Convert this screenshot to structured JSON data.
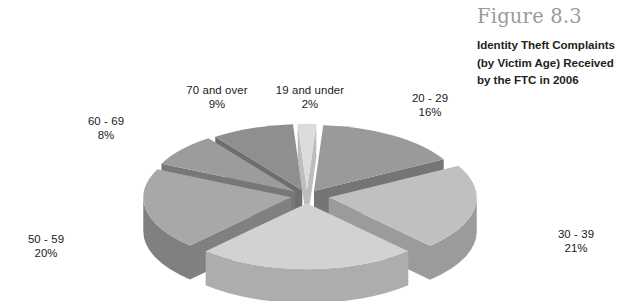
{
  "figure": {
    "number": "Figure 8.3",
    "caption_lines": [
      "Identity Theft Complaints",
      "(by Victim Age) Received",
      "by the FTC in 2006"
    ]
  },
  "chart_data": {
    "type": "pie",
    "title": "Identity Theft Complaints (by Victim Age) Received by the FTC in 2006",
    "subtitle": "Figure 8.3",
    "xlabel": "",
    "ylabel": "",
    "grid": false,
    "legend_position": "none",
    "style": "exploded-3d",
    "units": "percent",
    "background": "#ffffff",
    "categories": [
      "19 and under",
      "20 - 29",
      "30 - 39",
      "40 - 49",
      "50 - 59",
      "60 - 69",
      "70 and over"
    ],
    "values": [
      2,
      16,
      21,
      24,
      20,
      8,
      9
    ],
    "labels_shown": [
      "19 and under",
      "20 - 29",
      "30 - 39",
      "",
      "50 - 59",
      "60 - 69",
      "70 and over"
    ],
    "value_labels": [
      "2%",
      "16%",
      "21%",
      "",
      "20%",
      "8%",
      "9%"
    ],
    "colors": [
      "#dcdcdc",
      "#9a9a9a",
      "#c0c0c0",
      "#d2d2d2",
      "#a8a8a8",
      "#9c9c9c",
      "#8f8f8f"
    ],
    "side_colors": [
      "#bdbdbd",
      "#757575",
      "#9b9b9b",
      "#adadad",
      "#808080",
      "#777777",
      "#6e6e6e"
    ]
  },
  "slices": [
    {
      "id": "19-and-under",
      "name": "19 and under",
      "percent": "2%",
      "value": 2,
      "top_color": "#dcdcdc",
      "side_color": "#bdbdbd",
      "start_deg": -3.6,
      "sweep_deg": 7.2,
      "explode": 14,
      "label_x": 310,
      "label_y": 84
    },
    {
      "id": "20-29",
      "name": "20 - 29",
      "percent": "16%",
      "value": 16,
      "top_color": "#9a9a9a",
      "side_color": "#757575",
      "start_deg": 3.6,
      "sweep_deg": 57.6,
      "explode": 13,
      "label_x": 430,
      "label_y": 92
    },
    {
      "id": "30-39",
      "name": "30 - 39",
      "percent": "21%",
      "value": 21,
      "top_color": "#c0c0c0",
      "side_color": "#9b9b9b",
      "start_deg": 61.2,
      "sweep_deg": 75.6,
      "explode": 22,
      "label_x": 576,
      "label_y": 228
    },
    {
      "id": "40-49",
      "name": "40 - 49",
      "percent": "",
      "value": 24,
      "top_color": "#d2d2d2",
      "side_color": "#adadad",
      "start_deg": 136.8,
      "sweep_deg": 86.4,
      "explode": 16,
      "label_x": -999,
      "label_y": -999
    },
    {
      "id": "50-59",
      "name": "50 - 59",
      "percent": "20%",
      "value": 20,
      "top_color": "#a8a8a8",
      "side_color": "#808080",
      "start_deg": 223.2,
      "sweep_deg": 72.0,
      "explode": 16,
      "label_x": 46,
      "label_y": 233
    },
    {
      "id": "60-69",
      "name": "60 - 69",
      "percent": "8%",
      "value": 8,
      "top_color": "#9c9c9c",
      "side_color": "#777777",
      "start_deg": 295.2,
      "sweep_deg": 28.8,
      "explode": 15,
      "label_x": 106,
      "label_y": 115
    },
    {
      "id": "70-and-over",
      "name": "70 and over",
      "percent": "9%",
      "value": 9,
      "top_color": "#8f8f8f",
      "side_color": "#6e6e6e",
      "start_deg": 324.0,
      "sweep_deg": 32.4,
      "explode": 14,
      "label_x": 217,
      "label_y": 84
    }
  ],
  "geometry": {
    "cx": 307,
    "cy": 196,
    "rx": 148,
    "ry": 66,
    "depth": 34
  }
}
